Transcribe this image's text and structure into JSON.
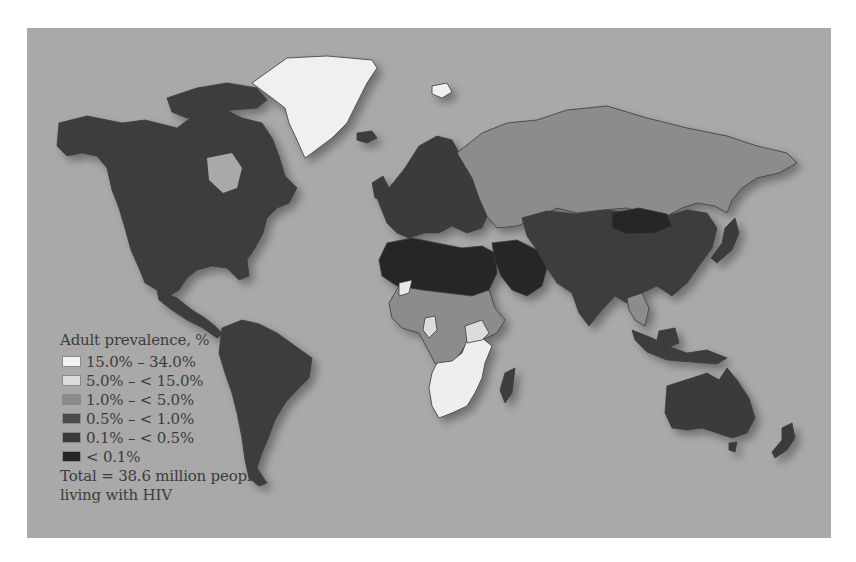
{
  "map": {
    "title": "Adult HIV prevalence world map",
    "background_color": "#a9a9a9",
    "legend": {
      "title": "Adult prevalence, %",
      "items": [
        {
          "label": "15.0% – 34.0%",
          "color": "#f2f2f2"
        },
        {
          "label": "5.0% – < 15.0%",
          "color": "#dcdcdc"
        },
        {
          "label": "1.0% – < 5.0%",
          "color": "#8c8c8c"
        },
        {
          "label": "0.5% – < 1.0%",
          "color": "#4a4a4a"
        },
        {
          "label": "0.1% – < 0.5%",
          "color": "#3a3a3a"
        },
        {
          "label": "< 0.1%",
          "color": "#252525"
        }
      ],
      "total_line1": "Total = 38.6 million people",
      "total_line2": "living with HIV"
    },
    "regions": {
      "north_america": "0.1% – < 0.5%",
      "greenland": "15.0% – 34.0%",
      "south_america": "0.5% – < 1.0%",
      "europe": "0.1% – < 0.5%",
      "russia": "1.0% – < 5.0%",
      "north_africa_middle_east": "< 0.1%",
      "central_africa": "1.0% – < 5.0%",
      "southern_africa": "15.0% – 34.0%",
      "asia": "0.1% – < 0.5%",
      "mongolia": "< 0.1%",
      "australia": "0.1% – < 0.5%"
    }
  }
}
